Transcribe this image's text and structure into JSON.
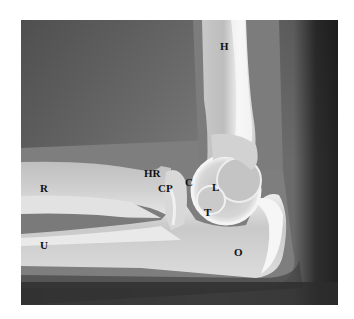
{
  "image": {
    "subject": "Lateral elbow radiograph",
    "background_color": "#ffffff"
  },
  "labels": [
    {
      "id": "H",
      "text": "H",
      "meaning": "humerus",
      "x": 220,
      "y": 41
    },
    {
      "id": "HR",
      "text": "HR",
      "meaning": "head of radius",
      "x": 144,
      "y": 168
    },
    {
      "id": "R",
      "text": "R",
      "meaning": "radius",
      "x": 40,
      "y": 183
    },
    {
      "id": "CP",
      "text": "CP",
      "meaning": "coronoid process",
      "x": 158,
      "y": 183
    },
    {
      "id": "C",
      "text": "C",
      "meaning": "capitulum",
      "x": 185,
      "y": 177
    },
    {
      "id": "L",
      "text": "L",
      "meaning": "lateral condyle",
      "x": 212,
      "y": 182
    },
    {
      "id": "T",
      "text": "T",
      "meaning": "trochlea",
      "x": 204,
      "y": 207
    },
    {
      "id": "U",
      "text": "U",
      "meaning": "ulna",
      "x": 40,
      "y": 240
    },
    {
      "id": "O",
      "text": "O",
      "meaning": "olecranon",
      "x": 234,
      "y": 247
    }
  ]
}
